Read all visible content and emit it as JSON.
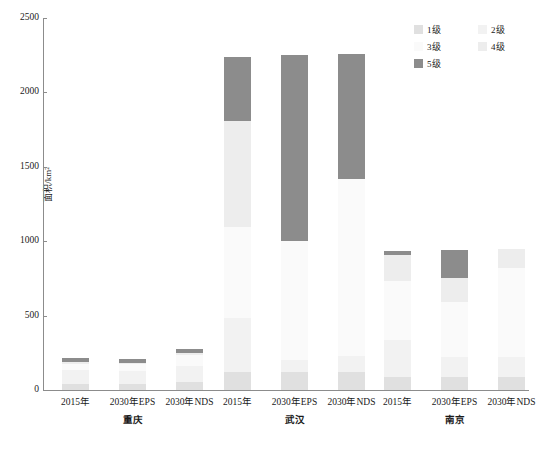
{
  "chart_data": {
    "type": "bar",
    "stacked": true,
    "title": "",
    "xlabel": "",
    "ylabel": "面积/km²",
    "ylim": [
      0,
      2500
    ],
    "ytick_labels": [
      "0",
      "500",
      "1000",
      "1500",
      "2000",
      "2500"
    ],
    "ytick_values": [
      0,
      500,
      1000,
      1500,
      2000,
      2500
    ],
    "grid": false,
    "legend_position": "top-right",
    "legend": [
      "1级",
      "2级",
      "3级",
      "4级",
      "5级"
    ],
    "series": [
      {
        "name": "1级",
        "color": "#e0e0e0",
        "values": [
          40,
          38,
          55,
          120,
          120,
          120,
          90,
          90,
          85
        ]
      },
      {
        "name": "2级",
        "color": "#f2f2f2",
        "values": [
          95,
          92,
          105,
          365,
          85,
          110,
          245,
          130,
          135
        ]
      },
      {
        "name": "3级",
        "color": "#fafafa",
        "values": [
          40,
          42,
          75,
          610,
          795,
          1190,
          395,
          370,
          600
        ]
      },
      {
        "name": "4级",
        "color": "#ededed",
        "values": [
          10,
          10,
          12,
          715,
          0,
          0,
          175,
          165,
          125
        ]
      },
      {
        "name": "5级",
        "color": "#8c8c8c",
        "values": [
          30,
          28,
          32,
          425,
          1250,
          840,
          30,
          185,
          0
        ]
      }
    ],
    "categories": [
      "2015年",
      "2030年EPS",
      "2030年NDS",
      "2015年",
      "2030年EPS",
      "2030年NDS",
      "2015年",
      "2030年EPS",
      "2030年NDS"
    ],
    "groups": [
      {
        "label": "重庆",
        "categories": [
          "2015年",
          "2030年EPS",
          "2030年NDS"
        ],
        "totals": [
          215,
          210,
          279
        ]
      },
      {
        "label": "武汉",
        "categories": [
          "2015年",
          "2030年EPS",
          "2030年NDS"
        ],
        "totals": [
          2235,
          2250,
          2260
        ]
      },
      {
        "label": "南京",
        "categories": [
          "2015年",
          "2030年EPS",
          "2030年NDS"
        ],
        "totals": [
          935,
          940,
          945
        ]
      }
    ]
  },
  "axis": {
    "y_title": "面积/km²"
  },
  "legend": {
    "items": [
      {
        "label": "1级",
        "color": "#e0e0e0"
      },
      {
        "label": "2级",
        "color": "#f2f2f2"
      },
      {
        "label": "3级",
        "color": "#fafafa"
      },
      {
        "label": "4级",
        "color": "#ededed"
      },
      {
        "label": "5级",
        "color": "#8c8c8c"
      }
    ]
  },
  "x_labels": [
    "2015年",
    "2030年EPS",
    "2030年NDS",
    "2015年",
    "2030年EPS",
    "2030年NDS",
    "2015年",
    "2030年EPS",
    "2030年NDS"
  ],
  "group_labels": [
    "重庆",
    "武汉",
    "南京"
  ]
}
